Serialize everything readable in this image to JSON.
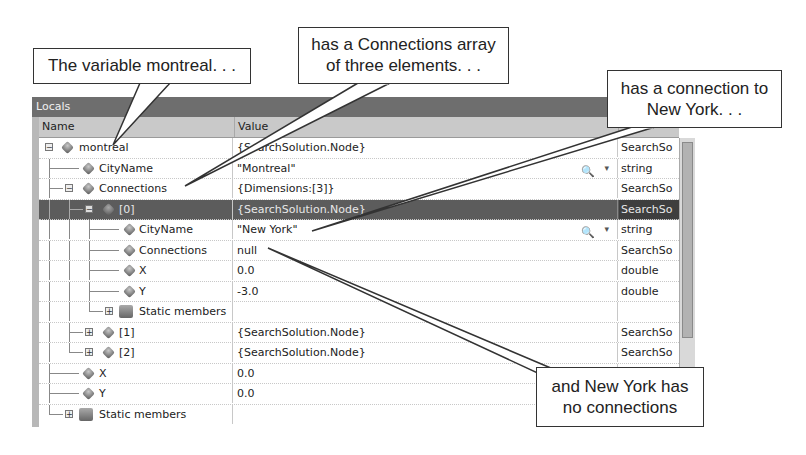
{
  "window": {
    "title": "Locals"
  },
  "columns": {
    "name": "Name",
    "value": "Value",
    "type": "Type"
  },
  "rows": [
    {
      "name": "montreal",
      "value": "{SearchSolution.Node}",
      "type": "SearchSo",
      "level": 0,
      "expander": "minus",
      "icon": "field"
    },
    {
      "name": "CityName",
      "value": "\"Montreal\"",
      "type": "string",
      "level": 1,
      "expander": "none",
      "icon": "field",
      "visualizer": true
    },
    {
      "name": "Connections",
      "value": "{Dimensions:[3]}",
      "type": "SearchSo",
      "level": 1,
      "expander": "minus",
      "icon": "field"
    },
    {
      "name": "[0]",
      "value": "{SearchSolution.Node}",
      "type": "SearchSo",
      "level": 2,
      "expander": "minus",
      "icon": "field",
      "selected": true
    },
    {
      "name": "CityName",
      "value": "\"New York\"",
      "type": "string",
      "level": 3,
      "expander": "none",
      "icon": "field",
      "visualizer": true
    },
    {
      "name": "Connections",
      "value": "null",
      "type": "SearchSo",
      "level": 3,
      "expander": "none",
      "icon": "field"
    },
    {
      "name": "X",
      "value": "0.0",
      "type": "double",
      "level": 3,
      "expander": "none",
      "icon": "field"
    },
    {
      "name": "Y",
      "value": "-3.0",
      "type": "double",
      "level": 3,
      "expander": "none",
      "icon": "field"
    },
    {
      "name": "Static members",
      "value": "",
      "type": "",
      "level": 3,
      "expander": "plus",
      "icon": "static"
    },
    {
      "name": "[1]",
      "value": "{SearchSolution.Node}",
      "type": "SearchSo",
      "level": 2,
      "expander": "plus",
      "icon": "field"
    },
    {
      "name": "[2]",
      "value": "{SearchSolution.Node}",
      "type": "SearchSo",
      "level": 2,
      "expander": "plus",
      "icon": "field"
    },
    {
      "name": "X",
      "value": "0.0",
      "type": "",
      "level": 1,
      "expander": "none",
      "icon": "field"
    },
    {
      "name": "Y",
      "value": "0.0",
      "type": "",
      "level": 1,
      "expander": "none",
      "icon": "field"
    },
    {
      "name": "Static members",
      "value": "",
      "type": "",
      "level": 1,
      "expander": "plus",
      "icon": "static"
    }
  ],
  "callouts": {
    "c1": "The variable montreal. . .",
    "c2_line1": "has a Connections array",
    "c2_line2": "of three elements. . .",
    "c3_line1": "has a connection to",
    "c3_line2": "New York. . .",
    "c4_line1": "and New York has",
    "c4_line2": "no connections"
  },
  "icons": {
    "expand": "+",
    "collapse": "−",
    "visualizer": "magnifier-icon",
    "dropdown": "▾"
  }
}
